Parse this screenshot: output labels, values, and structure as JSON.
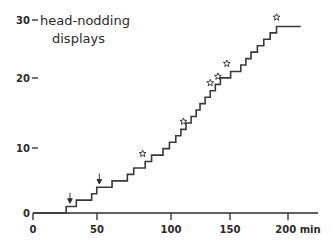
{
  "chart_data": {
    "type": "line",
    "subtype": "cumulative-step",
    "title": "head-nodding displays",
    "title_lines": [
      "head-nodding",
      "displays"
    ],
    "xlabel": "min",
    "ylabel": "",
    "xlim": [
      0,
      210
    ],
    "ylim": [
      0,
      31
    ],
    "grid": false,
    "legend": null,
    "x_ticks": [
      0,
      50,
      100,
      150,
      200
    ],
    "x_tick_labels": [
      "0",
      "50",
      "100",
      "150",
      "200 min"
    ],
    "y_ticks": [
      0,
      10,
      20,
      30
    ],
    "y_tick_labels": [
      "0",
      "10",
      "20",
      "30"
    ],
    "series": [
      {
        "name": "cumulative head-nodding displays",
        "step_type": "post",
        "x": [
          0,
          24,
          26,
          30,
          34,
          40,
          46,
          50,
          56,
          62,
          68,
          74,
          79,
          84,
          88,
          93,
          98,
          102,
          107,
          112,
          116,
          120,
          124,
          128,
          131,
          135,
          139,
          143,
          147,
          151,
          155,
          159,
          163,
          167,
          171,
          176,
          181,
          186,
          191,
          196,
          201,
          210
        ],
        "y": [
          0,
          0,
          1,
          1,
          2,
          2,
          3,
          4,
          4,
          5,
          5,
          6,
          7,
          7,
          8,
          9,
          9,
          10,
          11,
          12,
          13,
          14,
          15,
          16,
          17,
          18,
          19,
          20,
          21,
          21,
          22,
          22,
          23,
          24,
          25,
          26,
          27,
          28,
          29,
          29,
          29,
          29
        ]
      }
    ],
    "markers": [
      {
        "type": "arrow-down",
        "x": 29,
        "y": 1.6,
        "label": "disturbance"
      },
      {
        "type": "arrow-down",
        "x": 52,
        "y": 4.6,
        "label": "disturbance"
      },
      {
        "type": "star",
        "x": 86,
        "y": 8.6,
        "label": "copulation"
      },
      {
        "type": "star",
        "x": 118,
        "y": 13.6,
        "label": "copulation"
      },
      {
        "type": "star",
        "x": 139,
        "y": 19.6,
        "label": "copulation"
      },
      {
        "type": "star",
        "x": 145,
        "y": 20.6,
        "label": "copulation"
      },
      {
        "type": "star",
        "x": 152,
        "y": 22.6,
        "label": "copulation"
      },
      {
        "type": "star",
        "x": 191,
        "y": 29.8,
        "label": "copulation"
      }
    ],
    "annotations": []
  },
  "axes": {
    "y_axis_name": "cumulative-count-axis",
    "x_axis_name": "time-axis"
  }
}
